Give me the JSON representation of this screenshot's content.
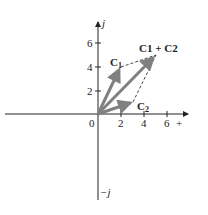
{
  "diagram": {
    "type": "complex-plane-vector-addition",
    "axes": {
      "imag_positive_label": "j",
      "imag_negative_label": "−j",
      "real_positive_label": "+",
      "origin_label": "0",
      "x_ticks": [
        "2",
        "4",
        "6"
      ],
      "y_ticks": [
        "2",
        "4",
        "6"
      ]
    },
    "vectors": [
      {
        "name": "C1",
        "label_main": "C",
        "label_sub": "1",
        "end": [
          2,
          4
        ]
      },
      {
        "name": "C2",
        "label_main": "C",
        "label_sub": "2",
        "end": [
          3,
          1
        ]
      },
      {
        "name": "C1+C2",
        "label": "C1 + C2",
        "end": [
          5,
          5
        ]
      }
    ],
    "colors": {
      "axis": "#222222",
      "vector": "#808080",
      "dashed": "#333333"
    }
  }
}
